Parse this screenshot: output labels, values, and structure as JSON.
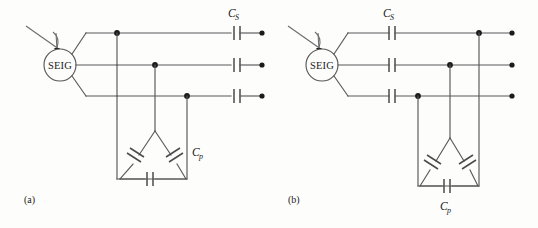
{
  "figure": {
    "background_color": "#fdfdfb",
    "wire_color": "#58585a",
    "node_color": "#1b1b1b",
    "text_color": "#1b1b1b"
  },
  "subfigures": [
    {
      "key": "a",
      "caption": "(a)",
      "machine_label": "SEIG",
      "machine_type": "self-excited-induction-generator",
      "shaft_input": "prime-mover-shaft-arrow",
      "series_capacitor_label": "C",
      "series_capacitor_subscript": "S",
      "series_capacitor_position": "load-side-after-shunt-bank",
      "shunt_capacitor_label": "C",
      "shunt_capacitor_subscript": "p",
      "shunt_bank_connection": "delta",
      "shunt_capacitor_count": 3,
      "series_capacitor_count": 3,
      "phase_count": 3,
      "terminal_count": 3
    },
    {
      "key": "b",
      "caption": "(b)",
      "machine_label": "SEIG",
      "machine_type": "self-excited-induction-generator",
      "shaft_input": "prime-mover-shaft-arrow",
      "series_capacitor_label": "C",
      "series_capacitor_subscript": "S",
      "series_capacitor_position": "generator-side-before-shunt-bank",
      "shunt_capacitor_label": "C",
      "shunt_capacitor_subscript": "p",
      "shunt_bank_connection": "delta",
      "shunt_capacitor_count": 3,
      "series_capacitor_count": 3,
      "phase_count": 3,
      "terminal_count": 3
    }
  ]
}
